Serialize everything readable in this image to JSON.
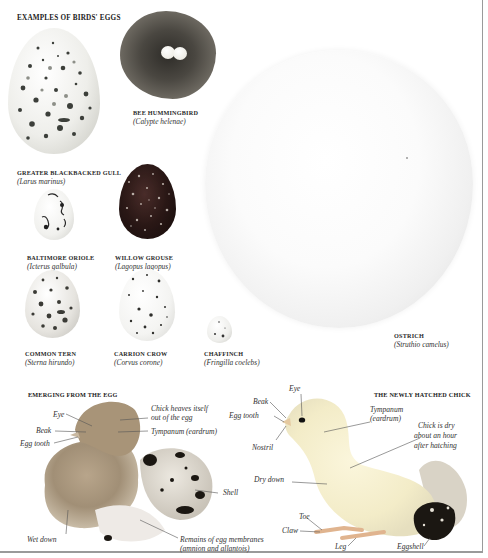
{
  "page": {
    "colors": {
      "background": "#ffffff",
      "border": "#9a9a9a",
      "text": "#222222"
    }
  },
  "eggs_section": {
    "heading": "EXAMPLES OF BIRDS' EGGS",
    "eggs": [
      {
        "common_name": "GREATER BLACKBACKED GULL",
        "scientific_name": "(Larus marinus)"
      },
      {
        "common_name": "BEE HUMMINGBIRD",
        "scientific_name": "(Calypte helenae)"
      },
      {
        "common_name": "BALTIMORE ORIOLE",
        "scientific_name": "(Icterus galbula)"
      },
      {
        "common_name": "WILLOW GROUSE",
        "scientific_name": "(Lagopus lagopus)"
      },
      {
        "common_name": "COMMON TERN",
        "scientific_name": "(Sterna hirundo)"
      },
      {
        "common_name": "CARRION CROW",
        "scientific_name": "(Corvus corone)"
      },
      {
        "common_name": "CHAFFINCH",
        "scientific_name": "(Fringilla coelebs)"
      },
      {
        "common_name": "OSTRICH",
        "scientific_name": "(Struthio camelus)"
      }
    ]
  },
  "emerging_section": {
    "heading": "EMERGING FROM THE EGG",
    "labels": {
      "eye": "Eye",
      "beak": "Beak",
      "egg_tooth": "Egg tooth",
      "heaves_1": "Chick heaves itself",
      "heaves_2": "out of the egg",
      "tympanum": "Tympanum (eardrum)",
      "shell": "Shell",
      "wet_down": "Wet down",
      "membranes_1": "Remains of egg membranes",
      "membranes_2": "(amnion and allantois)"
    }
  },
  "hatched_section": {
    "heading": "THE NEWLY HATCHED CHICK",
    "labels": {
      "eye": "Eye",
      "beak": "Beak",
      "egg_tooth": "Egg tooth",
      "nostril": "Nostril",
      "tympanum_1": "Tympanum",
      "tympanum_2": "(eardrum)",
      "dry_1": "Chick is dry",
      "dry_2": "about an hour",
      "dry_3": "after hatching",
      "dry_down": "Dry down",
      "toe": "Toe",
      "claw": "Claw",
      "leg": "Leg",
      "eggshell": "Eggshell"
    }
  }
}
